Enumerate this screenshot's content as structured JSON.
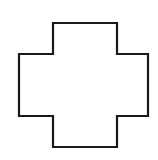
{
  "diagram": {
    "shape": "cross",
    "stroke_color": "#1a1a1a",
    "fill_color": "#ffffff",
    "stroke_width": 2.2,
    "points": [
      [
        53,
        23
      ],
      [
        117,
        23
      ],
      [
        117,
        54
      ],
      [
        148,
        54
      ],
      [
        148,
        116
      ],
      [
        117,
        116
      ],
      [
        117,
        147
      ],
      [
        53,
        147
      ],
      [
        53,
        116
      ],
      [
        19,
        116
      ],
      [
        19,
        54
      ],
      [
        53,
        54
      ]
    ]
  }
}
